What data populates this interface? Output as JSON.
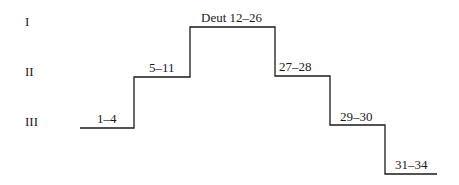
{
  "levels": [
    {
      "label": "I"
    },
    {
      "label": "II"
    },
    {
      "label": "III"
    }
  ],
  "steps": [
    {
      "label": "1–4",
      "level": "III"
    },
    {
      "label": "5–11",
      "level": "II"
    },
    {
      "label": "Deut 12–26",
      "level": "I"
    },
    {
      "label": "27–28",
      "level": "II"
    },
    {
      "label": "29–30",
      "level": "III"
    },
    {
      "label": "31–34",
      "level": "below III"
    }
  ],
  "line_color": "#1a1a1a"
}
